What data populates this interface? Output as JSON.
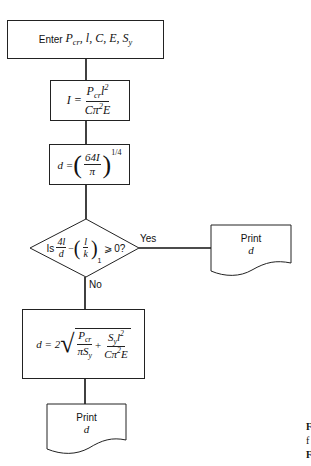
{
  "flowchart": {
    "input": {
      "prefix": "Enter",
      "vars": "P",
      "vars_sub": "cr",
      "vars_rest": ", l, C, E, S",
      "vars_rest_sub": "y"
    },
    "step_I": {
      "lhs": "I =",
      "num_a": "P",
      "num_sub": "cr",
      "num_b": "l",
      "num_sup": "2",
      "den_a": "Cπ",
      "den_sup": "2",
      "den_b": "E"
    },
    "step_d": {
      "lhs": "d =",
      "num": "64I",
      "den": "π",
      "exponent": "1/4"
    },
    "decision": {
      "prefix": "Is",
      "frac1_num": "4l",
      "frac1_den": "d",
      "minus": "−",
      "frac2_num": "l",
      "frac2_den": "k",
      "subscript": "1",
      "suffix": "⩾ 0?",
      "yes_label": "Yes",
      "no_label": "No"
    },
    "print_yes": {
      "line1": "Print",
      "line2": "d"
    },
    "step_d2": {
      "lhs": "d = 2",
      "t1_num_a": "P",
      "t1_num_sub": "cr",
      "t1_den_a": "πS",
      "t1_den_sub": "y",
      "plus": "+",
      "t2_num_a": "S",
      "t2_num_sub": "y",
      "t2_num_b": "l",
      "t2_num_sup": "2",
      "t2_den_a": "Cπ",
      "t2_den_sup": "2",
      "t2_den_b": "E"
    },
    "print_no": {
      "line1": "Print",
      "line2": "d"
    },
    "caption_fragment": [
      "F",
      "f",
      "F"
    ]
  }
}
